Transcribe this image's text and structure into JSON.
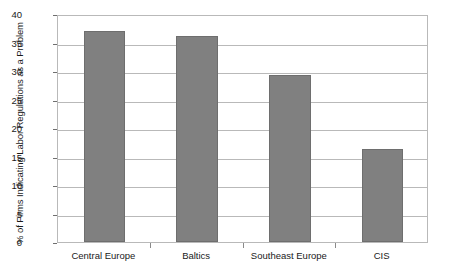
{
  "chart_data": {
    "type": "bar",
    "title": "",
    "xlabel": "",
    "ylabel": "% of Firms Indicating Labor Regulations as a Problem",
    "categories": [
      "Central Europe",
      "Baltics",
      "Southeast Europe",
      "CIS"
    ],
    "values": [
      37.1,
      36.2,
      29.3,
      16.4
    ],
    "ylim": [
      0,
      40
    ],
    "yticks": [
      0,
      5,
      10,
      15,
      20,
      25,
      30,
      35,
      40
    ],
    "ytick_labels": [
      "0",
      "5",
      "10",
      "15",
      "20",
      "25",
      "30",
      "35",
      "40"
    ],
    "grid": true,
    "legend": "none",
    "bar_color": "#808080",
    "bar_border_color": "#6e6e6e",
    "gridline_color": "#b9b9b9",
    "plot_border_color": "#b9b9b9",
    "background_color": "#ffffff",
    "text_color": "#1a1a1a"
  }
}
